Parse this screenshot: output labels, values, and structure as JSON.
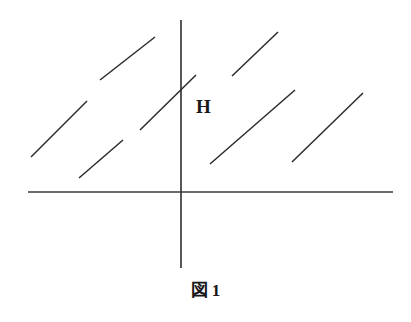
{
  "figure": {
    "caption_symbol": "図",
    "caption_number": "1",
    "caption_full": "図 1",
    "region_label": "H",
    "region_label_x": 196,
    "region_label_y": 97,
    "stroke_color": "#2b2b2b",
    "axis_color": "#3a3a3a",
    "background_color": "#ffffff"
  },
  "chart_data": {
    "type": "line",
    "xlabel": "",
    "ylabel": "",
    "grid": false,
    "legend": null,
    "annotations": [
      {
        "text": "H",
        "x": 196,
        "y": 107,
        "role": "half-plane-region-label"
      }
    ],
    "axes": {
      "x_axis": {
        "x1": 28,
        "y1": 192,
        "x2": 393,
        "y2": 192
      },
      "y_axis": {
        "x1": 181,
        "y1": 20,
        "x2": 181,
        "y2": 268
      },
      "origin": {
        "x": 181,
        "y": 192
      }
    },
    "hatch_lines": [
      {
        "x1": 31,
        "y1": 157,
        "x2": 87,
        "y2": 101
      },
      {
        "x1": 79,
        "y1": 178,
        "x2": 123,
        "y2": 140
      },
      {
        "x1": 100,
        "y1": 80,
        "x2": 155,
        "y2": 37
      },
      {
        "x1": 140,
        "y1": 130,
        "x2": 196,
        "y2": 75
      },
      {
        "x1": 232,
        "y1": 76,
        "x2": 278,
        "y2": 32
      },
      {
        "x1": 210,
        "y1": 164,
        "x2": 295,
        "y2": 90
      },
      {
        "x1": 292,
        "y1": 162,
        "x2": 363,
        "y2": 93
      }
    ]
  }
}
